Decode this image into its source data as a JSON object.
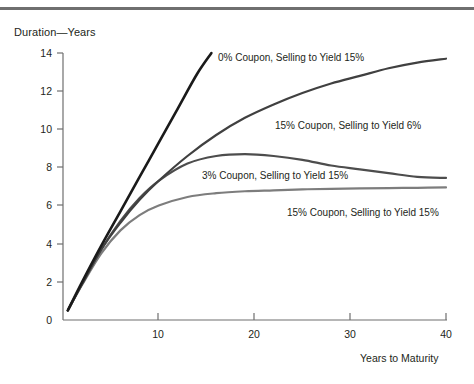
{
  "chart_data": {
    "type": "line",
    "title": "",
    "ylabel": "Duration—Years",
    "xlabel": "Years to Maturity",
    "xlim": [
      0,
      41
    ],
    "ylim": [
      0,
      14.6
    ],
    "grid": false,
    "legend_position": "inline-annotations",
    "xticks": [
      10,
      20,
      30,
      40
    ],
    "xtick_labels": [
      "10",
      "20",
      "30",
      "40"
    ],
    "yticks": [
      0,
      2,
      4,
      6,
      8,
      10,
      12,
      14
    ],
    "ytick_labels": [
      "0",
      "2",
      "4",
      "6",
      "8",
      "10",
      "12",
      "14"
    ],
    "series": [
      {
        "name": "0% Coupon, Selling to Yield 15%",
        "color": "#1a1a1a",
        "width": 2.6,
        "x": [
          0.5,
          2,
          4,
          6,
          8,
          10,
          12,
          14,
          15.5
        ],
        "values": [
          0.5,
          2.0,
          3.9,
          5.7,
          7.5,
          9.3,
          11.1,
          12.9,
          14.0
        ]
      },
      {
        "name": "15% Coupon, Selling to Yield 6%",
        "color": "#404040",
        "width": 2.2,
        "x": [
          0.5,
          2,
          4,
          6,
          8,
          10,
          13,
          16,
          19,
          22,
          25,
          28,
          31,
          34,
          37,
          40
        ],
        "values": [
          0.5,
          1.9,
          3.7,
          5.1,
          6.3,
          7.3,
          8.6,
          9.7,
          10.6,
          11.3,
          11.9,
          12.4,
          12.8,
          13.2,
          13.5,
          13.7
        ]
      },
      {
        "name": "3% Coupon, Selling to Yield 15%",
        "color": "#4d4d4d",
        "width": 2.2,
        "x": [
          0.5,
          2,
          4,
          6,
          8,
          10,
          13,
          16,
          19,
          22,
          25,
          28,
          31,
          34,
          37,
          40
        ],
        "values": [
          0.5,
          1.9,
          3.7,
          5.2,
          6.4,
          7.3,
          8.2,
          8.6,
          8.7,
          8.6,
          8.4,
          8.1,
          7.9,
          7.7,
          7.5,
          7.45
        ]
      },
      {
        "name": "15% Coupon, Selling to Yield 15%",
        "color": "#7d7d7d",
        "width": 2.2,
        "x": [
          0.5,
          2,
          4,
          6,
          8,
          10,
          13,
          16,
          19,
          22,
          25,
          28,
          31,
          34,
          37,
          40
        ],
        "values": [
          0.5,
          1.85,
          3.5,
          4.7,
          5.5,
          6.0,
          6.45,
          6.65,
          6.75,
          6.8,
          6.85,
          6.88,
          6.9,
          6.92,
          6.93,
          6.95
        ]
      }
    ],
    "annotations": [
      {
        "text": "0% Coupon, Selling to Yield 15%",
        "x_px": 218,
        "y_px": 52
      },
      {
        "text": "15% Coupon, Selling to Yield 6%",
        "x_px": 275,
        "y_px": 120
      },
      {
        "text": "3% Coupon, Selling to Yield 15%",
        "x_px": 202,
        "y_px": 170
      },
      {
        "text": "15% Coupon, Selling to Yield 15%",
        "x_px": 287,
        "y_px": 207
      }
    ]
  }
}
